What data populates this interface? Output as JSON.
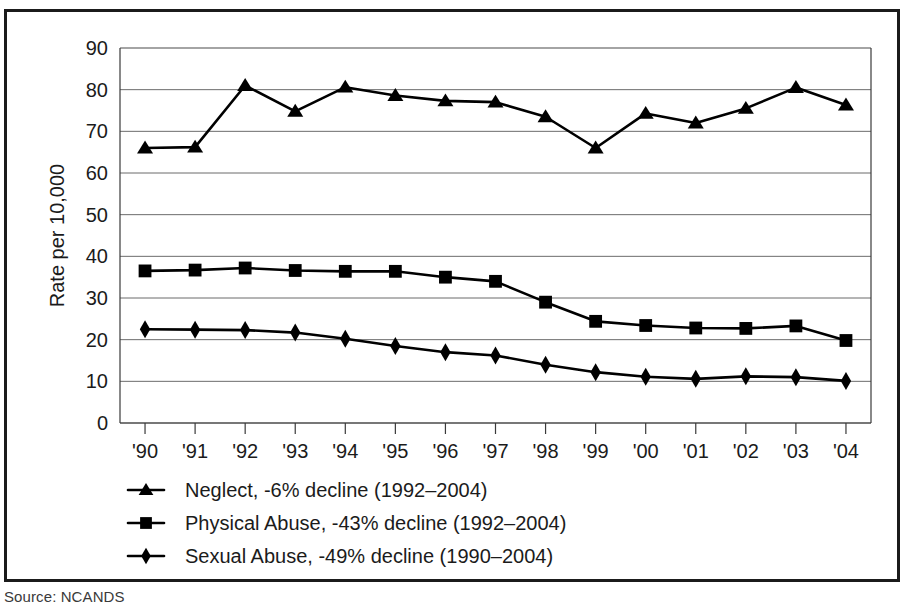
{
  "figure": {
    "source_note": "Source: NCANDS",
    "frame_color": "#1b1b1b",
    "background": "#ffffff"
  },
  "chart_data": {
    "type": "line",
    "title": "",
    "xlabel": "",
    "ylabel": "Rate per 10,000",
    "x": [
      "'90",
      "'91",
      "'92",
      "'93",
      "'94",
      "'95",
      "'96",
      "'97",
      "'98",
      "'99",
      "'00",
      "'01",
      "'02",
      "'03",
      "'04"
    ],
    "categories": [
      "'90",
      "'91",
      "'92",
      "'93",
      "'94",
      "'95",
      "'96",
      "'97",
      "'98",
      "'99",
      "'00",
      "'01",
      "'02",
      "'03",
      "'04"
    ],
    "xtick_labels": [
      "'90",
      "'91",
      "'92",
      "'93",
      "'94",
      "'95",
      "'96",
      "'97",
      "'98",
      "'99",
      "'00",
      "'01",
      "'02",
      "'03",
      "'04"
    ],
    "ytick_labels": [
      "0",
      "10",
      "20",
      "30",
      "40",
      "50",
      "60",
      "70",
      "80",
      "90"
    ],
    "yticks": [
      0,
      10,
      20,
      30,
      40,
      50,
      60,
      70,
      80,
      90
    ],
    "ylim": [
      0,
      90
    ],
    "grid": "horizontal",
    "legend_position": "below-axes",
    "series": [
      {
        "name": "Neglect",
        "legend_label": "Neglect, -6% decline (1992–2004)",
        "marker": "triangle",
        "color": "#000000",
        "values": [
          66.0,
          66.2,
          81.0,
          74.8,
          80.6,
          78.6,
          77.3,
          77.0,
          73.5,
          66.0,
          74.3,
          72.0,
          75.5,
          80.5,
          76.3
        ]
      },
      {
        "name": "Physical Abuse",
        "legend_label": "Physical Abuse, -43% decline (1992–2004)",
        "marker": "square",
        "color": "#000000",
        "values": [
          36.5,
          36.7,
          37.2,
          36.6,
          36.4,
          36.4,
          35.0,
          34.0,
          29.0,
          24.4,
          23.4,
          22.8,
          22.7,
          23.3,
          19.8
        ]
      },
      {
        "name": "Sexual Abuse",
        "legend_label": "Sexual Abuse, -49% decline (1990–2004)",
        "marker": "diamond",
        "color": "#000000",
        "values": [
          22.5,
          22.4,
          22.3,
          21.7,
          20.2,
          18.5,
          17.0,
          16.2,
          14.0,
          12.2,
          11.1,
          10.6,
          11.2,
          11.0,
          10.1
        ]
      }
    ]
  }
}
